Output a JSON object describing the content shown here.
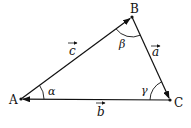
{
  "diagram": {
    "type": "vector-triangle",
    "vertices": {
      "A": {
        "label": "A",
        "x": 21,
        "y": 99
      },
      "B": {
        "label": "B",
        "x": 132,
        "y": 17
      },
      "C": {
        "label": "C",
        "x": 170,
        "y": 100
      }
    },
    "vectors": [
      {
        "name": "c",
        "label": "c",
        "from": "A",
        "to": "B"
      },
      {
        "name": "a",
        "label": "a",
        "from": "B",
        "to": "C"
      },
      {
        "name": "b",
        "label": "b",
        "from": "C",
        "to": "A"
      }
    ],
    "angles": [
      {
        "vertex": "A",
        "label": "α"
      },
      {
        "vertex": "B",
        "label": "β"
      },
      {
        "vertex": "C",
        "label": "γ"
      }
    ],
    "colors": {
      "stroke": "#111111",
      "background": "#ffffff"
    }
  }
}
